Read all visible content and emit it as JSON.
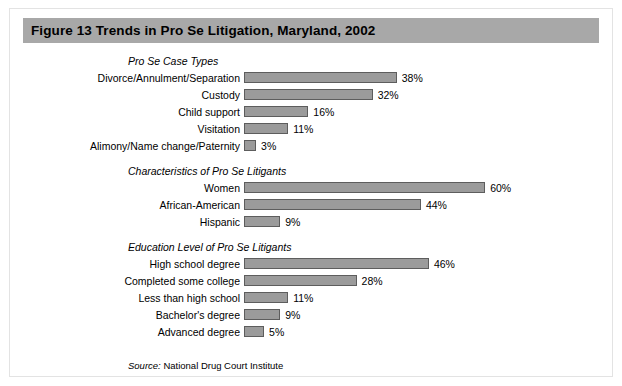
{
  "figure": {
    "title": "Figure 13  Trends in Pro Se Litigation, Maryland, 2002",
    "source_label": "Source:",
    "source_text": " National Drug Court Institute",
    "header_color": "#a8a8a8",
    "bar_color": "#9b9b9b",
    "bar_border_color": "#5d5d5d"
  },
  "chart_data": {
    "type": "bar",
    "title": "Figure 13  Trends in Pro Se Litigation, Maryland, 2002",
    "xlabel": "",
    "ylabel": "",
    "xlim": [
      0,
      60
    ],
    "grid": false,
    "legend": "none",
    "orientation": "horizontal",
    "units": "percent",
    "annotations": [
      "Source: National Drug Court Institute"
    ],
    "groups": [
      {
        "heading": "Pro Se Case Types",
        "categories": [
          "Divorce/Annulment/Separation",
          "Custody",
          "Child support",
          "Visitation",
          "Alimony/Name change/Paternity"
        ],
        "values": [
          38,
          32,
          16,
          11,
          3
        ],
        "labels": [
          "38%",
          "32%",
          "16%",
          "11%",
          "3%"
        ]
      },
      {
        "heading": "Characteristics of Pro Se Litigants",
        "categories": [
          "Women",
          "African-American",
          "Hispanic"
        ],
        "values": [
          60,
          44,
          9
        ],
        "labels": [
          "60%",
          "44%",
          "9%"
        ]
      },
      {
        "heading": "Education Level of Pro Se Litigants",
        "categories": [
          "High school degree",
          "Completed some college",
          "Less than high school",
          "Bachelor's degree",
          "Advanced degree"
        ],
        "values": [
          46,
          28,
          11,
          9,
          5
        ],
        "labels": [
          "46%",
          "28%",
          "11%",
          "9%",
          "5%"
        ]
      }
    ]
  }
}
